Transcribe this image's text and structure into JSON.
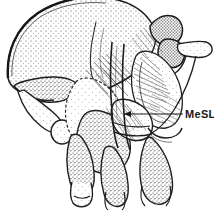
{
  "figure": {
    "type": "scientific-line-drawing",
    "background_color": "#ffffff",
    "ink_color": "#1a1a1a",
    "stipple_color": "#5a5a5a"
  },
  "labels": [
    {
      "id": "mesl",
      "text": "MeSL",
      "x": 185,
      "y": 109,
      "leader": {
        "from_x": 183,
        "from_y": 114,
        "to_x": 122,
        "to_y": 114,
        "arrowhead": "left"
      }
    }
  ]
}
